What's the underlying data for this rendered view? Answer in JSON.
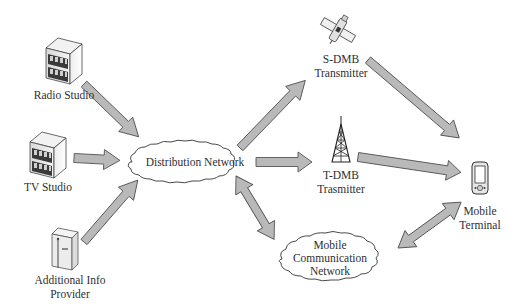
{
  "diagram": {
    "type": "dmb-broadcast-architecture",
    "colors": {
      "arrow_fill": "#b9b9b9",
      "arrow_stroke": "#555555",
      "cloud_fill": "#ffffff",
      "cloud_stroke": "#333333",
      "text": "#2f2f2f"
    },
    "nodes": {
      "radio_studio": {
        "label": "Radio Studio",
        "icon": "building-icon"
      },
      "tv_studio": {
        "label": "TV Studio",
        "icon": "building-icon"
      },
      "info_provider": {
        "label_line1": "Additional Info",
        "label_line2": "Provider",
        "icon": "server-icon"
      },
      "distribution_network": {
        "label": "Distribution Network",
        "shape": "cloud"
      },
      "sdmb": {
        "label_line1": "S-DMB",
        "label_line2": "Transmitter",
        "icon": "satellite-icon"
      },
      "tdmb": {
        "label_line1": "T-DMB",
        "label_line2": "Trasmitter",
        "icon": "antenna-tower-icon"
      },
      "mobile_comm": {
        "label_line1": "Mobile",
        "label_line2": "Communication",
        "label_line3": "Network",
        "shape": "cloud"
      },
      "mobile_terminal": {
        "label_line1": "Mobile",
        "label_line2": "Terminal",
        "icon": "pda-icon"
      }
    },
    "edges": [
      {
        "from": "Radio Studio",
        "to": "Distribution Network",
        "direction": "one-way"
      },
      {
        "from": "TV Studio",
        "to": "Distribution Network",
        "direction": "one-way"
      },
      {
        "from": "Additional Info Provider",
        "to": "Distribution Network",
        "direction": "one-way"
      },
      {
        "from": "Distribution Network",
        "to": "S-DMB Transmitter",
        "direction": "one-way"
      },
      {
        "from": "Distribution Network",
        "to": "T-DMB Trasmitter",
        "direction": "one-way"
      },
      {
        "from": "Distribution Network",
        "to": "Mobile Communication Network",
        "direction": "two-way"
      },
      {
        "from": "S-DMB Transmitter",
        "to": "Mobile Terminal",
        "direction": "one-way"
      },
      {
        "from": "T-DMB Trasmitter",
        "to": "Mobile Terminal",
        "direction": "one-way"
      },
      {
        "from": "Mobile Communication Network",
        "to": "Mobile Terminal",
        "direction": "two-way"
      }
    ]
  }
}
